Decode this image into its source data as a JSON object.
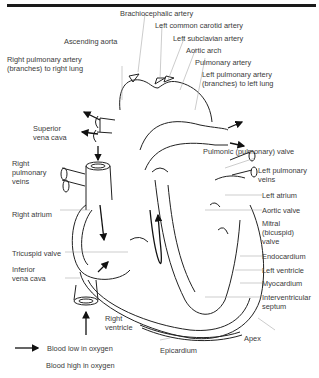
{
  "diagram": {
    "type": "labeled anatomical diagram",
    "labels": {
      "brachiocephalic_artery": "Brachiocephalic artery",
      "left_common_carotid_artery": "Left common carotid artery",
      "left_subclavian_artery": "Left subclavian artery",
      "ascending_aorta": "Ascending aorta",
      "aortic_arch": "Aortic arch",
      "pulmonary_artery": "Pulmonary artery",
      "right_pulmonary_artery": "Right pulmonary artery",
      "right_pulmonary_artery_2": "(branches) to right lung",
      "left_pulmonary_artery": "Left pulmonary artery",
      "left_pulmonary_artery_2": "(branches) to left lung",
      "superior_vena_cava_1": "Superior",
      "superior_vena_cava_2": "vena cava",
      "right_pulmonary_veins_1": "Right",
      "right_pulmonary_veins_2": "pulmonary",
      "right_pulmonary_veins_3": "veins",
      "pulmonic_valve": "Pulmonic (pulmonary) valve",
      "left_pulmonary_veins_1": "Left pulmonary",
      "left_pulmonary_veins_2": "veins",
      "right_atrium": "Right atrium",
      "left_atrium": "Left atrium",
      "aortic_valve": "Aortic valve",
      "mitral_valve_1": "Mitral",
      "mitral_valve_2": "(bicuspid)",
      "mitral_valve_3": "valve",
      "tricuspid_valve": "Tricuspid valve",
      "endocardium": "Endocardium",
      "left_ventricle": "Left ventricle",
      "myocardium": "Myocardium",
      "inferior_vena_cava_1": "Inferior",
      "inferior_vena_cava_2": "vena cava",
      "interventricular_septum_1": "Interventricular",
      "interventricular_septum_2": "septum",
      "right_ventricle_1": "Right",
      "right_ventricle_2": "ventricle",
      "apex": "Apex",
      "epicardium": "Epicardium"
    },
    "legend": [
      {
        "label": "Blood low in oxygen",
        "marker": "arrow"
      },
      {
        "label": "Blood high in oxygen",
        "marker": "none"
      }
    ]
  }
}
